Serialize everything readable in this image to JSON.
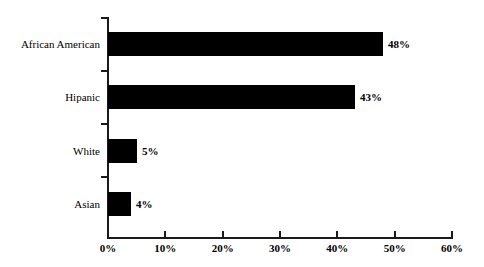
{
  "chart_data": {
    "type": "bar",
    "orientation": "horizontal",
    "title": "",
    "subtitle": "",
    "xlabel": "",
    "ylabel": "",
    "categories": [
      "African American",
      "Hipanic",
      "White",
      "Asian"
    ],
    "values": [
      48,
      43,
      5,
      4
    ],
    "value_labels": [
      "48%",
      "43%",
      "5%",
      "4%"
    ],
    "xlim": [
      0,
      60
    ],
    "xticks": [
      0,
      10,
      20,
      30,
      40,
      50,
      60
    ],
    "xtick_labels": [
      "0%",
      "10%",
      "20%",
      "30%",
      "40%",
      "50%",
      "60%"
    ],
    "grid": false,
    "legend": null,
    "legend_position": "none",
    "bar_color": "#000000",
    "axis_color": "#1a1a1a",
    "background_color": "#ffffff",
    "annotations": []
  }
}
